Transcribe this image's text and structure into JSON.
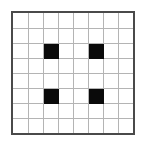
{
  "figure": {
    "kind": "grid-pattern",
    "canvas": {
      "width_px": 143,
      "height_px": 143,
      "background_color": "#ffffff"
    }
  },
  "grid": {
    "rows": 8,
    "columns": 8,
    "cell_size_px": 15,
    "origin_x_px": 11,
    "origin_y_px": 11,
    "border_color": "#4a4a4a",
    "border_width_px": 2,
    "gridline_color": "#b4b4b4",
    "gridline_width_px": 1,
    "empty_cell_color": "#ffffff",
    "filled_cell_color": "#0a0a0a",
    "filled_count": 4,
    "filled_cells": [
      {
        "row": 2,
        "col": 2
      },
      {
        "row": 2,
        "col": 5
      },
      {
        "row": 5,
        "col": 2
      },
      {
        "row": 5,
        "col": 5
      }
    ],
    "cell_matrix": [
      [
        0,
        0,
        0,
        0,
        0,
        0,
        0,
        0
      ],
      [
        0,
        0,
        0,
        0,
        0,
        0,
        0,
        0
      ],
      [
        0,
        0,
        1,
        0,
        0,
        1,
        0,
        0
      ],
      [
        0,
        0,
        0,
        0,
        0,
        0,
        0,
        0
      ],
      [
        0,
        0,
        0,
        0,
        0,
        0,
        0,
        0
      ],
      [
        0,
        0,
        1,
        0,
        0,
        1,
        0,
        0
      ],
      [
        0,
        0,
        0,
        0,
        0,
        0,
        0,
        0
      ],
      [
        0,
        0,
        0,
        0,
        0,
        0,
        0,
        0
      ]
    ]
  },
  "chart_data": {
    "type": "heatmap",
    "title": "",
    "xlabel": "",
    "ylabel": "",
    "categories_x": [
      "0",
      "1",
      "2",
      "3",
      "4",
      "5",
      "6",
      "7"
    ],
    "categories_y": [
      "0",
      "1",
      "2",
      "3",
      "4",
      "5",
      "6",
      "7"
    ],
    "values": [
      [
        0,
        0,
        0,
        0,
        0,
        0,
        0,
        0
      ],
      [
        0,
        0,
        0,
        0,
        0,
        0,
        0,
        0
      ],
      [
        0,
        0,
        1,
        0,
        0,
        1,
        0,
        0
      ],
      [
        0,
        0,
        0,
        0,
        0,
        0,
        0,
        0
      ],
      [
        0,
        0,
        0,
        0,
        0,
        0,
        0,
        0
      ],
      [
        0,
        0,
        1,
        0,
        0,
        1,
        0,
        0
      ],
      [
        0,
        0,
        0,
        0,
        0,
        0,
        0,
        0
      ],
      [
        0,
        0,
        0,
        0,
        0,
        0,
        0,
        0
      ]
    ],
    "colorscale": {
      "0": "#ffffff",
      "1": "#0a0a0a"
    },
    "grid": true,
    "legend": "none"
  }
}
